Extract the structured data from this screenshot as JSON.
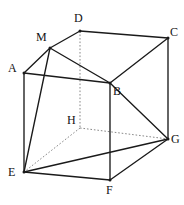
{
  "figure": {
    "kind": "geometry-diagram",
    "canvas": {
      "width": 184,
      "height": 205
    },
    "background_color": "#ffffff",
    "solid_edge_color": "#1a1a1a",
    "hidden_edge_color": "#7a7a7a",
    "label_color": "#121212",
    "vertices": [
      {
        "id": "A",
        "label": "A",
        "x": 24,
        "y": 73,
        "label_x": 8,
        "label_y": 62,
        "hidden": false
      },
      {
        "id": "B",
        "label": "B",
        "x": 110,
        "y": 83,
        "label_x": 113,
        "label_y": 85,
        "hidden": false
      },
      {
        "id": "C",
        "label": "C",
        "x": 168,
        "y": 38,
        "label_x": 170,
        "label_y": 26,
        "hidden": false
      },
      {
        "id": "D",
        "label": "D",
        "x": 80,
        "y": 31,
        "label_x": 74,
        "label_y": 12,
        "hidden": false
      },
      {
        "id": "E",
        "label": "E",
        "x": 24,
        "y": 172,
        "label_x": 8,
        "label_y": 166,
        "hidden": false
      },
      {
        "id": "F",
        "label": "F",
        "x": 110,
        "y": 180,
        "label_x": 106,
        "label_y": 184,
        "hidden": false
      },
      {
        "id": "G",
        "label": "G",
        "x": 168,
        "y": 139,
        "label_x": 171,
        "label_y": 133,
        "hidden": false
      },
      {
        "id": "H",
        "label": "H",
        "x": 80,
        "y": 128,
        "label_x": 67,
        "label_y": 114,
        "hidden": true
      },
      {
        "id": "M",
        "label": "M",
        "x": 50,
        "y": 48,
        "label_x": 36,
        "label_y": 31,
        "hidden": false
      }
    ],
    "edges": [
      {
        "from": "M",
        "to": "D",
        "style": "solid",
        "name": "edge-m-d"
      },
      {
        "from": "A",
        "to": "M",
        "style": "solid",
        "name": "edge-a-m"
      },
      {
        "from": "D",
        "to": "C",
        "style": "solid",
        "name": "edge-d-c"
      },
      {
        "from": "A",
        "to": "B",
        "style": "solid",
        "name": "edge-a-b"
      },
      {
        "from": "B",
        "to": "C",
        "style": "solid",
        "name": "edge-b-c"
      },
      {
        "from": "A",
        "to": "E",
        "style": "solid",
        "name": "edge-a-e"
      },
      {
        "from": "B",
        "to": "F",
        "style": "solid",
        "name": "edge-b-f"
      },
      {
        "from": "C",
        "to": "G",
        "style": "solid",
        "name": "edge-c-g"
      },
      {
        "from": "E",
        "to": "F",
        "style": "solid",
        "name": "edge-e-f"
      },
      {
        "from": "F",
        "to": "G",
        "style": "solid",
        "name": "edge-f-g"
      },
      {
        "from": "E",
        "to": "G",
        "style": "solid",
        "name": "diagonal-e-g"
      },
      {
        "from": "M",
        "to": "B",
        "style": "solid",
        "name": "segment-m-b"
      },
      {
        "from": "M",
        "to": "E",
        "style": "solid",
        "name": "segment-m-e"
      },
      {
        "from": "B",
        "to": "G",
        "style": "solid",
        "name": "segment-b-g"
      },
      {
        "from": "D",
        "to": "H",
        "style": "hidden",
        "name": "edge-d-h"
      },
      {
        "from": "H",
        "to": "E",
        "style": "hidden",
        "name": "edge-h-e"
      },
      {
        "from": "H",
        "to": "G",
        "style": "hidden",
        "name": "edge-h-g"
      }
    ]
  }
}
